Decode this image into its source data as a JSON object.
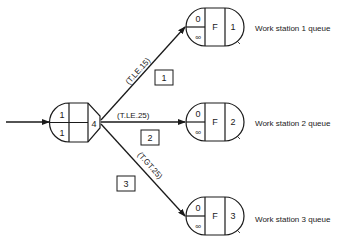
{
  "source_node": {
    "top_left": "1",
    "bottom_left": "1",
    "right": "4"
  },
  "branches": [
    {
      "condition": "(T.LE.15)",
      "activity": "1"
    },
    {
      "condition": "(T.LE.25)",
      "activity": "2"
    },
    {
      "condition": "(T.GT.25)",
      "activity": "3"
    }
  ],
  "queues": [
    {
      "initial": "0",
      "capacity": "∞",
      "rule": "F",
      "number": "1",
      "label": "Work station 1 queue"
    },
    {
      "initial": "0",
      "capacity": "∞",
      "rule": "F",
      "number": "2",
      "label": "Work station 2 queue"
    },
    {
      "initial": "0",
      "capacity": "∞",
      "rule": "F",
      "number": "3",
      "label": "Work station 3 queue"
    }
  ]
}
